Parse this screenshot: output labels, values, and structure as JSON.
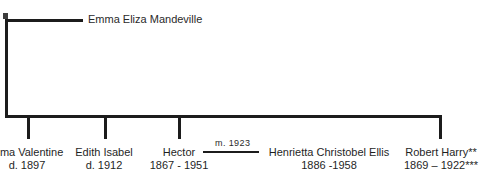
{
  "chart_type": "family-tree",
  "root": {
    "marker_name": "parent-union-marker",
    "spouse_label": "Emma Eliza Mandeville"
  },
  "marriage": {
    "label": "m.  1923"
  },
  "children": [
    {
      "name": "mma Valentine",
      "dates": "d. 1897",
      "slug": "emma-valentine"
    },
    {
      "name": "Edith Isabel",
      "dates": "d. 1912",
      "slug": "edith-isabel"
    },
    {
      "name": "Hector",
      "dates": "1867 - 1951",
      "slug": "hector"
    },
    {
      "name": "Robert Harry**",
      "dates": "1869 – 1922***",
      "slug": "robert-harry"
    }
  ],
  "spouses": [
    {
      "name": "Henrietta Christobel Ellis",
      "dates": "1886 -1958",
      "slug": "henrietta-christobel-ellis"
    }
  ],
  "colors": {
    "line": "#1c1c1c",
    "text": "#1f1f1f",
    "background": "#ffffff"
  }
}
